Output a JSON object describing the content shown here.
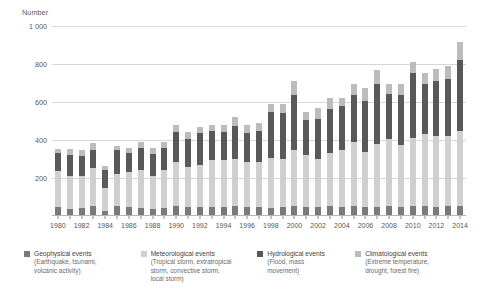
{
  "chart_data": {
    "type": "bar",
    "stacked": true,
    "title": "",
    "subtitle": "",
    "xlabel": "",
    "ylabel": "Number",
    "ylim": [
      0,
      1000
    ],
    "yticks": [
      200,
      400,
      600,
      800,
      1000
    ],
    "ytick_labels": [
      "200",
      "400",
      "600",
      "800",
      "1 000"
    ],
    "grid": true,
    "legend_position": "bottom",
    "categories": [
      "1980",
      "1981",
      "1982",
      "1983",
      "1984",
      "1985",
      "1986",
      "1987",
      "1988",
      "1989",
      "1990",
      "1991",
      "1992",
      "1993",
      "1994",
      "1995",
      "1996",
      "1997",
      "1998",
      "1999",
      "2000",
      "2001",
      "2002",
      "2003",
      "2004",
      "2005",
      "2006",
      "2007",
      "2008",
      "2009",
      "2010",
      "2011",
      "2012",
      "2013",
      "2014"
    ],
    "xtick_labels": [
      "1980",
      "",
      "1982",
      "",
      "1984",
      "",
      "1986",
      "",
      "1988",
      "",
      "1990",
      "",
      "1992",
      "",
      "1994",
      "",
      "1996",
      "",
      "1998",
      "",
      "2000",
      "",
      "2002",
      "",
      "2004",
      "",
      "2006",
      "",
      "2008",
      "",
      "2010",
      "",
      "2012",
      "",
      "2014"
    ],
    "series": [
      {
        "name": "Geophysical events",
        "color": "#7a7a7c",
        "values": [
          50,
          38,
          40,
          52,
          25,
          55,
          48,
          44,
          38,
          42,
          52,
          48,
          45,
          50,
          45,
          55,
          48,
          45,
          42,
          48,
          55,
          48,
          50,
          55,
          48,
          52,
          48,
          50,
          55,
          48,
          52,
          55,
          50,
          52,
          55
        ]
      },
      {
        "name": "Meteorological events",
        "color": "#d0d0d0",
        "values": [
          185,
          175,
          170,
          200,
          125,
          165,
          185,
          200,
          175,
          200,
          230,
          210,
          225,
          245,
          250,
          245,
          235,
          240,
          265,
          250,
          290,
          275,
          250,
          275,
          300,
          335,
          290,
          330,
          350,
          325,
          360,
          375,
          370,
          370,
          395
        ]
      },
      {
        "name": "Hydrological events",
        "color": "#595959",
        "values": [
          95,
          110,
          105,
          95,
          90,
          125,
          100,
          115,
          115,
          115,
          160,
          145,
          165,
          150,
          145,
          175,
          155,
          165,
          240,
          245,
          290,
          180,
          210,
          235,
          230,
          250,
          270,
          315,
          235,
          265,
          340,
          265,
          290,
          300,
          370
        ]
      },
      {
        "name": "Climatological events",
        "color": "#bcbcbc",
        "values": [
          25,
          30,
          30,
          38,
          25,
          25,
          25,
          30,
          30,
          35,
          38,
          40,
          35,
          35,
          40,
          45,
          42,
          40,
          45,
          45,
          75,
          45,
          60,
          55,
          45,
          60,
          65,
          75,
          55,
          55,
          60,
          60,
          65,
          70,
          95
        ]
      }
    ]
  },
  "legend": [
    {
      "label": "Geophysical events",
      "sublabel_lines": [
        "(Earthquake, tsunami,",
        "volcanic activity)"
      ],
      "color": "#7a7a7c"
    },
    {
      "label": "Meteorological events",
      "sublabel_lines": [
        "(Tropical storm, extratropical",
        "storm, convective storm,",
        "local storm)"
      ],
      "color": "#d0d0d0"
    },
    {
      "label": "Hydrological events",
      "sublabel_lines": [
        "(Flood, mass",
        "movement)"
      ],
      "color": "#595959"
    },
    {
      "label": "Climatological events",
      "sublabel_lines": [
        "(Extreme temperature,",
        "drought, forest fire)"
      ],
      "color": "#bcbcbc"
    }
  ]
}
